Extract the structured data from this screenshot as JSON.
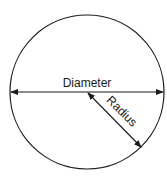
{
  "diagram": {
    "type": "circle-anatomy",
    "labels": {
      "diameter": "Diameter",
      "radius": "Radius"
    },
    "colors": {
      "stroke": "#1a1a1a",
      "background": "#ffffff"
    }
  }
}
